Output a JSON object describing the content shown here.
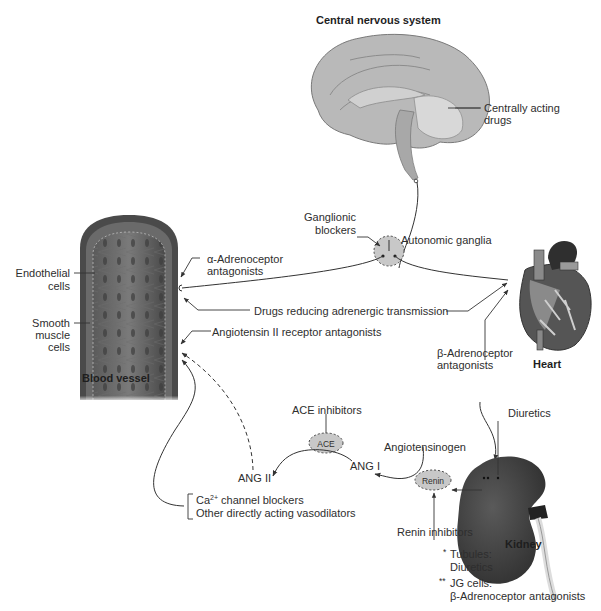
{
  "figure": {
    "organs": {
      "cns": "Central nervous system",
      "blood_vessel": "Blood vessel",
      "heart": "Heart",
      "kidney": "Kidney"
    },
    "labels": {
      "centrally_acting_1": "Centrally acting",
      "centrally_acting_2": "drugs",
      "ganglionic_1": "Ganglionic",
      "ganglionic_2": "blockers",
      "autonomic_ganglia": "Autonomic ganglia",
      "endothelial_1": "Endothelial",
      "endothelial_2": "cells",
      "smooth_1": "Smooth",
      "smooth_2": "muscle",
      "smooth_3": "cells",
      "alpha_1": "α-Adrenoceptor",
      "alpha_2": "antagonists",
      "drugs_reducing": "Drugs reducing adrenergic transmission",
      "angiotensin_receptor": "Angiotensin II receptor antagonists",
      "beta_1": "β-Adrenoceptor",
      "beta_2": "antagonists",
      "diuretics": "Diuretics",
      "ace_inhibitors": "ACE inhibitors",
      "ace": "ACE",
      "angiotensinogen": "Angiotensinogen",
      "ang_i": "ANG I",
      "ang_ii": "ANG II",
      "renin": "Renin",
      "renin_inhibitors": "Renin inhibitors",
      "ca_prefix": "Ca",
      "ca_sup": "2+",
      "ca_suffix": " channel blockers",
      "other_vasodilators": "Other directly acting vasodilators"
    },
    "footnotes": {
      "tubules_mark": "*",
      "tubules_1": "Tubules:",
      "tubules_2": "Diuretics",
      "jg_mark": "**",
      "jg_1": "JG cells:",
      "jg_2": "β-Adrenoceptor antagonists"
    },
    "colors": {
      "node_fill": "#c8c8c8",
      "organ_dark": "#3c3c3c",
      "line": "#333333"
    }
  }
}
